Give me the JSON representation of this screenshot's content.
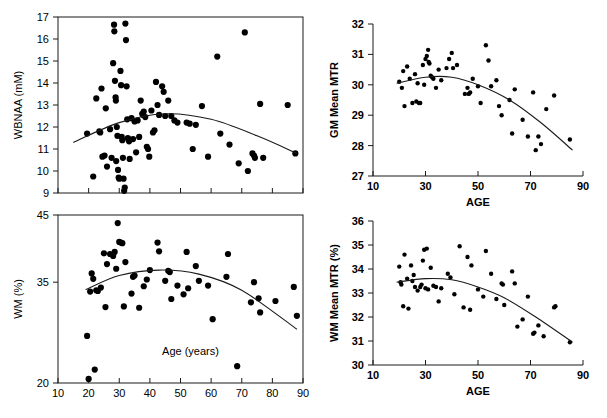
{
  "figure": {
    "title": "",
    "panel_count": 4
  },
  "chart_data": [
    {
      "id": "wbnaa-vs-age",
      "type": "scatter",
      "title": "",
      "xlabel": "Age (years)",
      "ylabel": "WBNAA (mM)",
      "xlim": [
        10,
        90
      ],
      "ylim": [
        9,
        17
      ],
      "xticks": [
        10,
        20,
        30,
        40,
        50,
        60,
        70,
        80,
        90
      ],
      "xticklabels": [
        "",
        "",
        "",
        "",
        "",
        "",
        "",
        "",
        ""
      ],
      "yticks": [
        9,
        10,
        11,
        12,
        13,
        14,
        15,
        16,
        17
      ],
      "yticklabels": [
        "9",
        "10",
        "11",
        "12",
        "13",
        "14",
        "15",
        "16",
        "17"
      ],
      "grid": false,
      "legend": "none",
      "frame": "box",
      "xlabel_position": "none",
      "points": [
        [
          19.5,
          11.7
        ],
        [
          21.5,
          9.75
        ],
        [
          22.5,
          13.3
        ],
        [
          23.5,
          11.8
        ],
        [
          23.8,
          11.75
        ],
        [
          24.2,
          13.75
        ],
        [
          24.5,
          10.65
        ],
        [
          25.2,
          10.7
        ],
        [
          25.6,
          12.85
        ],
        [
          26.0,
          10.2
        ],
        [
          27.0,
          11.9
        ],
        [
          27.5,
          10.6
        ],
        [
          28.0,
          14.9
        ],
        [
          28.3,
          16.65
        ],
        [
          28.4,
          16.35
        ],
        [
          28.6,
          14.1
        ],
        [
          28.8,
          13.35
        ],
        [
          28.9,
          13.2
        ],
        [
          29.0,
          10.45
        ],
        [
          29.2,
          12.0
        ],
        [
          29.4,
          11.6
        ],
        [
          29.6,
          10.05
        ],
        [
          29.8,
          9.7
        ],
        [
          30.0,
          9.65
        ],
        [
          30.4,
          14.55
        ],
        [
          30.6,
          13.9
        ],
        [
          30.8,
          11.55
        ],
        [
          31.0,
          11.4
        ],
        [
          31.2,
          10.6
        ],
        [
          31.4,
          9.65
        ],
        [
          31.6,
          9.1
        ],
        [
          31.8,
          9.25
        ],
        [
          32.0,
          16.7
        ],
        [
          32.2,
          15.95
        ],
        [
          32.4,
          13.85
        ],
        [
          32.6,
          12.35
        ],
        [
          32.8,
          11.5
        ],
        [
          33.0,
          11.45
        ],
        [
          33.2,
          11.35
        ],
        [
          33.4,
          10.55
        ],
        [
          34.0,
          12.4
        ],
        [
          34.5,
          11.45
        ],
        [
          35.0,
          12.25
        ],
        [
          35.5,
          10.85
        ],
        [
          36.0,
          12.3
        ],
        [
          36.5,
          11.55
        ],
        [
          37.0,
          13.2
        ],
        [
          37.5,
          12.6
        ],
        [
          37.8,
          12.55
        ],
        [
          38.0,
          12.7
        ],
        [
          38.5,
          12.45
        ],
        [
          39.0,
          11.1
        ],
        [
          39.4,
          11.0
        ],
        [
          39.8,
          10.65
        ],
        [
          40.5,
          12.75
        ],
        [
          41.0,
          11.75
        ],
        [
          41.5,
          11.85
        ],
        [
          42.0,
          14.05
        ],
        [
          42.5,
          13.0
        ],
        [
          43.0,
          12.55
        ],
        [
          44.0,
          13.85
        ],
        [
          44.5,
          13.6
        ],
        [
          45.0,
          12.5
        ],
        [
          46.0,
          13.2
        ],
        [
          47.0,
          12.5
        ],
        [
          48.0,
          12.3
        ],
        [
          49.0,
          12.2
        ],
        [
          52.0,
          12.2
        ],
        [
          53.0,
          12.15
        ],
        [
          54.0,
          11.0
        ],
        [
          55.0,
          12.1
        ],
        [
          57.0,
          12.95
        ],
        [
          59.0,
          10.65
        ],
        [
          62.0,
          15.2
        ],
        [
          63.0,
          11.7
        ],
        [
          66.0,
          11.2
        ],
        [
          69.0,
          10.35
        ],
        [
          71.0,
          16.3
        ],
        [
          72.0,
          10.0
        ],
        [
          73.5,
          10.8
        ],
        [
          74.0,
          10.7
        ],
        [
          74.3,
          10.6
        ],
        [
          76.0,
          13.05
        ],
        [
          77.0,
          10.6
        ],
        [
          85.0,
          13.0
        ],
        [
          87.5,
          10.8
        ]
      ],
      "fit": {
        "kind": "quadratic",
        "description": "inverted-U fit peaking near age 45",
        "x_start": 15,
        "x_end": 88,
        "coeffs_xy": [
          [
            15,
            11.3
          ],
          [
            30,
            12.2
          ],
          [
            45,
            12.6
          ],
          [
            60,
            12.35
          ],
          [
            75,
            11.6
          ],
          [
            88,
            10.8
          ]
        ]
      }
    },
    {
      "id": "wm-percent-vs-age",
      "type": "scatter",
      "title": "",
      "xlabel": "Age (years)",
      "ylabel": "WM (%)",
      "xlim": [
        10,
        90
      ],
      "ylim": [
        20,
        45
      ],
      "xticks": [
        10,
        20,
        30,
        40,
        50,
        60,
        70,
        80,
        90
      ],
      "xticklabels": [
        "10",
        "20",
        "30",
        "40",
        "50",
        "60",
        "70",
        "80",
        "90"
      ],
      "yticks": [
        20,
        35,
        45
      ],
      "yticklabels": [
        "20",
        "35",
        "45"
      ],
      "grid": false,
      "legend": "none",
      "frame": "box",
      "xlabel_position": "inside-plot",
      "points": [
        [
          19.5,
          27.0
        ],
        [
          20.0,
          20.6
        ],
        [
          20.5,
          33.6
        ],
        [
          21.0,
          36.3
        ],
        [
          21.5,
          35.5
        ],
        [
          22.0,
          22.0
        ],
        [
          22.5,
          33.8
        ],
        [
          23.0,
          33.7
        ],
        [
          24.0,
          34.2
        ],
        [
          25.0,
          39.3
        ],
        [
          25.5,
          31.3
        ],
        [
          26.0,
          37.7
        ],
        [
          27.0,
          39.2
        ],
        [
          28.0,
          38.9
        ],
        [
          28.5,
          39.5
        ],
        [
          29.0,
          37.0
        ],
        [
          29.5,
          43.8
        ],
        [
          30.0,
          41.0
        ],
        [
          30.5,
          40.9
        ],
        [
          31.0,
          40.8
        ],
        [
          31.5,
          31.4
        ],
        [
          32.0,
          38.0
        ],
        [
          34.0,
          33.3
        ],
        [
          34.5,
          35.8
        ],
        [
          35.0,
          36.0
        ],
        [
          36.5,
          31.2
        ],
        [
          38.0,
          34.4
        ],
        [
          39.0,
          35.4
        ],
        [
          40.0,
          36.8
        ],
        [
          42.5,
          40.9
        ],
        [
          43.0,
          39.6
        ],
        [
          45.0,
          35.2
        ],
        [
          46.0,
          36.7
        ],
        [
          46.5,
          36.5
        ],
        [
          47.0,
          32.5
        ],
        [
          49.0,
          34.5
        ],
        [
          51.0,
          33.2
        ],
        [
          52.0,
          39.5
        ],
        [
          52.5,
          34.1
        ],
        [
          55.0,
          37.4
        ],
        [
          56.0,
          35.2
        ],
        [
          59.0,
          34.5
        ],
        [
          60.5,
          29.5
        ],
        [
          65.0,
          35.8
        ],
        [
          65.5,
          39.2
        ],
        [
          68.5,
          22.5
        ],
        [
          73.0,
          32.0
        ],
        [
          74.0,
          35.0
        ],
        [
          75.5,
          32.6
        ],
        [
          76.0,
          30.5
        ],
        [
          81.0,
          32.2
        ],
        [
          87.0,
          34.3
        ],
        [
          88.0,
          30.0
        ]
      ],
      "fit": {
        "kind": "quadratic",
        "description": "inverted-U fit peaking near age 43",
        "x_start": 19,
        "x_end": 88,
        "coeffs_xy": [
          [
            19,
            33.9
          ],
          [
            30,
            36.0
          ],
          [
            43,
            36.8
          ],
          [
            56,
            36.2
          ],
          [
            70,
            33.8
          ],
          [
            88,
            28.0
          ]
        ]
      }
    },
    {
      "id": "gm-mean-mtr-vs-age",
      "type": "scatter",
      "title": "",
      "xlabel": "AGE",
      "ylabel": "GM Mean MTR",
      "xlim": [
        10,
        90
      ],
      "ylim": [
        27,
        32
      ],
      "xticks": [
        10,
        30,
        50,
        70,
        90
      ],
      "xticklabels": [
        "10",
        "30",
        "50",
        "70",
        "90"
      ],
      "yticks": [
        27,
        28,
        29,
        30,
        31,
        32
      ],
      "yticklabels": [
        "27",
        "28",
        "29",
        "30",
        "31",
        "32"
      ],
      "grid": false,
      "legend": "none",
      "frame": "L-shape",
      "xlabel_position": "below-axis",
      "points": [
        [
          20.0,
          30.1
        ],
        [
          21.0,
          29.9
        ],
        [
          21.5,
          30.45
        ],
        [
          22.0,
          29.3
        ],
        [
          23.0,
          30.6
        ],
        [
          24.0,
          30.2
        ],
        [
          25.0,
          29.4
        ],
        [
          26.0,
          30.35
        ],
        [
          26.5,
          29.45
        ],
        [
          27.0,
          30.05
        ],
        [
          27.5,
          29.4
        ],
        [
          28.0,
          29.4
        ],
        [
          29.0,
          30.65
        ],
        [
          29.5,
          30.0
        ],
        [
          30.0,
          30.85
        ],
        [
          30.5,
          30.95
        ],
        [
          31.0,
          31.15
        ],
        [
          31.2,
          30.75
        ],
        [
          31.5,
          30.7
        ],
        [
          32.0,
          30.3
        ],
        [
          32.5,
          30.25
        ],
        [
          33.0,
          30.2
        ],
        [
          34.0,
          29.9
        ],
        [
          35.0,
          30.5
        ],
        [
          36.0,
          30.15
        ],
        [
          38.0,
          30.55
        ],
        [
          39.0,
          30.85
        ],
        [
          40.0,
          31.05
        ],
        [
          40.5,
          30.55
        ],
        [
          42.0,
          30.65
        ],
        [
          45.0,
          29.7
        ],
        [
          46.0,
          29.9
        ],
        [
          46.5,
          29.7
        ],
        [
          47.0,
          29.75
        ],
        [
          48.0,
          30.2
        ],
        [
          50.0,
          29.95
        ],
        [
          51.0,
          29.4
        ],
        [
          53.0,
          31.3
        ],
        [
          54.0,
          30.8
        ],
        [
          55.0,
          29.95
        ],
        [
          57.0,
          30.15
        ],
        [
          58.0,
          29.3
        ],
        [
          59.0,
          29.0
        ],
        [
          62.0,
          29.5
        ],
        [
          63.0,
          28.4
        ],
        [
          64.0,
          29.85
        ],
        [
          67.0,
          28.85
        ],
        [
          69.0,
          28.3
        ],
        [
          71.0,
          29.75
        ],
        [
          72.0,
          27.85
        ],
        [
          73.0,
          28.3
        ],
        [
          74.0,
          28.05
        ],
        [
          76.0,
          29.2
        ],
        [
          79.0,
          29.65
        ],
        [
          85.0,
          28.2
        ]
      ],
      "fit": {
        "kind": "quadratic",
        "description": "flat then declining fit, gentle peak near age 35",
        "x_start": 19,
        "x_end": 86,
        "coeffs_xy": [
          [
            19,
            30.05
          ],
          [
            30,
            30.25
          ],
          [
            40,
            30.25
          ],
          [
            50,
            30.0
          ],
          [
            62,
            29.5
          ],
          [
            74,
            28.75
          ],
          [
            86,
            27.85
          ]
        ]
      }
    },
    {
      "id": "wm-mean-mtr-vs-age",
      "type": "scatter",
      "title": "",
      "xlabel": "AGE",
      "ylabel": "WM Mean MTR (%)",
      "xlim": [
        10,
        90
      ],
      "ylim": [
        30,
        36
      ],
      "xticks": [
        10,
        30,
        50,
        70,
        90
      ],
      "xticklabels": [
        "10",
        "30",
        "50",
        "70",
        "90"
      ],
      "yticks": [
        30,
        31,
        32,
        33,
        34,
        35,
        36
      ],
      "yticklabels": [
        "30",
        "31",
        "32",
        "33",
        "34",
        "35",
        "36"
      ],
      "grid": false,
      "legend": "none",
      "frame": "L-shape",
      "xlabel_position": "below-axis",
      "points": [
        [
          20.0,
          34.1
        ],
        [
          20.5,
          33.45
        ],
        [
          20.8,
          33.35
        ],
        [
          21.5,
          32.45
        ],
        [
          22.0,
          34.6
        ],
        [
          23.0,
          33.6
        ],
        [
          23.5,
          32.35
        ],
        [
          24.5,
          34.15
        ],
        [
          25.0,
          33.5
        ],
        [
          25.5,
          33.75
        ],
        [
          26.0,
          33.25
        ],
        [
          27.0,
          33.1
        ],
        [
          28.0,
          33.25
        ],
        [
          28.5,
          33.35
        ],
        [
          29.0,
          34.35
        ],
        [
          29.5,
          34.8
        ],
        [
          30.0,
          33.2
        ],
        [
          30.5,
          34.85
        ],
        [
          31.0,
          33.15
        ],
        [
          32.0,
          34.05
        ],
        [
          33.0,
          33.3
        ],
        [
          34.0,
          33.25
        ],
        [
          35.0,
          32.65
        ],
        [
          36.0,
          33.2
        ],
        [
          38.5,
          33.8
        ],
        [
          39.5,
          33.65
        ],
        [
          41.0,
          32.95
        ],
        [
          43.0,
          34.95
        ],
        [
          44.5,
          32.4
        ],
        [
          46.0,
          34.5
        ],
        [
          47.0,
          32.3
        ],
        [
          47.5,
          34.15
        ],
        [
          50.0,
          33.15
        ],
        [
          52.0,
          32.85
        ],
        [
          53.0,
          34.75
        ],
        [
          55.0,
          33.8
        ],
        [
          57.0,
          32.75
        ],
        [
          59.0,
          33.4
        ],
        [
          59.5,
          33.35
        ],
        [
          60.0,
          32.5
        ],
        [
          63.0,
          33.9
        ],
        [
          64.0,
          33.4
        ],
        [
          65.0,
          31.6
        ],
        [
          67.0,
          31.9
        ],
        [
          69.0,
          32.85
        ],
        [
          71.0,
          31.3
        ],
        [
          71.5,
          31.35
        ],
        [
          73.0,
          31.65
        ],
        [
          75.0,
          31.2
        ],
        [
          79.0,
          32.4
        ],
        [
          79.5,
          32.45
        ],
        [
          85.0,
          30.95
        ]
      ],
      "fit": {
        "kind": "quadratic",
        "description": "flat then declining fit, gentle peak near age 33",
        "x_start": 19,
        "x_end": 86,
        "coeffs_xy": [
          [
            19,
            33.45
          ],
          [
            30,
            33.6
          ],
          [
            40,
            33.55
          ],
          [
            50,
            33.25
          ],
          [
            60,
            32.8
          ],
          [
            72,
            32.0
          ],
          [
            86,
            30.95
          ]
        ]
      }
    }
  ]
}
